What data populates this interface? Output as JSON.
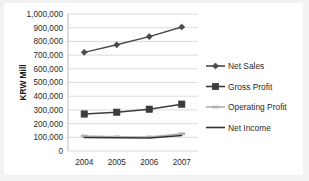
{
  "chart_data": {
    "type": "line",
    "title": "",
    "subtitle": "",
    "xlabel": "",
    "ylabel": "KRW Mill",
    "categories": [
      "2004",
      "2005",
      "2006",
      "2007"
    ],
    "ylim": [
      0,
      1000000
    ],
    "ytick_step": 100000,
    "ytick_labels": [
      "0",
      "100,000",
      "200,000",
      "300,000",
      "400,000",
      "500,000",
      "600,000",
      "700,000",
      "800,000",
      "900,000",
      "1,000,000"
    ],
    "ytick_values": [
      0,
      100000,
      200000,
      300000,
      400000,
      500000,
      600000,
      700000,
      800000,
      900000,
      1000000
    ],
    "grid": true,
    "grid_axis": "y",
    "legend_position": "right",
    "series": [
      {
        "name": "Net Sales",
        "marker": "diamond",
        "color": "#4a4a4a",
        "values": [
          720000,
          775000,
          835000,
          905000
        ]
      },
      {
        "name": "Gross Profit",
        "marker": "square",
        "color": "#3c3c3c",
        "values": [
          270000,
          283000,
          305000,
          342000
        ]
      },
      {
        "name": "Operating Profit",
        "marker": "dash",
        "color": "#b0b0b0",
        "values": [
          110000,
          104000,
          103000,
          126000
        ]
      },
      {
        "name": "Net Income",
        "marker": "none",
        "color": "#333333",
        "values": [
          99000,
          96000,
          94000,
          114000
        ]
      }
    ]
  },
  "colors": {
    "page_background": "#f2f2f2",
    "plot_background": "#ffffff",
    "gridline": "#d2d2d2",
    "axis": "#b5b5b5",
    "text": "#2b2b2b"
  }
}
